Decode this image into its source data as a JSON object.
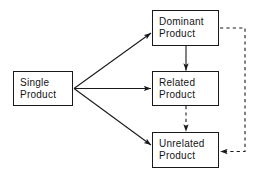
{
  "diagram": {
    "background_color": "#ffffff",
    "line_color": "#1a1a1a",
    "nodes": [
      {
        "id": "single",
        "line1": "Single",
        "line2": "Product",
        "x": 13,
        "y": 71,
        "w": 60,
        "h": 35
      },
      {
        "id": "dominant",
        "line1": "Dominant",
        "line2": "Product",
        "x": 152,
        "y": 10,
        "w": 67,
        "h": 36
      },
      {
        "id": "related",
        "line1": "Related",
        "line2": "Product",
        "x": 152,
        "y": 71,
        "w": 67,
        "h": 35
      },
      {
        "id": "unrelated",
        "line1": "Unrelated",
        "line2": "Product",
        "x": 152,
        "y": 132,
        "w": 67,
        "h": 36
      }
    ],
    "edges": [
      {
        "id": "single-to-dominant",
        "from": "single",
        "to": "dominant",
        "style": "solid",
        "direction": "diagonal-up-right"
      },
      {
        "id": "single-to-related",
        "from": "single",
        "to": "related",
        "style": "solid",
        "direction": "horizontal-right"
      },
      {
        "id": "single-to-unrelated",
        "from": "single",
        "to": "unrelated",
        "style": "solid",
        "direction": "diagonal-down-right"
      },
      {
        "id": "dominant-to-related",
        "from": "dominant",
        "to": "related",
        "style": "solid",
        "direction": "vertical-down"
      },
      {
        "id": "related-to-unrelated",
        "from": "related",
        "to": "unrelated",
        "style": "dashed",
        "direction": "vertical-down"
      },
      {
        "id": "dominant-to-unrelated",
        "from": "dominant",
        "to": "unrelated",
        "style": "dashed",
        "direction": "right-loop-around"
      }
    ]
  }
}
